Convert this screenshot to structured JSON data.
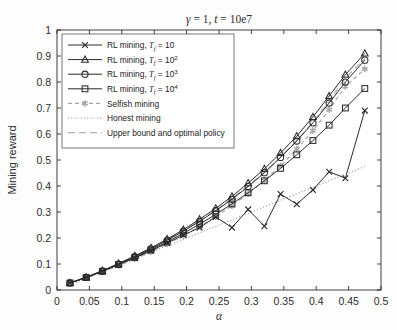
{
  "chart_data": {
    "type": "line",
    "title": "γ = 1,  t = 10e7",
    "title_parts": {
      "gamma_sym": "γ",
      "gamma_eq": " = 1,  ",
      "t_sym": "t",
      "t_eq": " = 10e7"
    },
    "xlabel": "α",
    "ylabel": "Mining reward",
    "xlim": [
      0,
      0.5
    ],
    "ylim": [
      0,
      1
    ],
    "xticks": [
      0,
      0.05,
      0.1,
      0.15,
      0.2,
      0.25,
      0.3,
      0.35,
      0.4,
      0.45,
      0.5
    ],
    "xtick_labels": [
      "0",
      "0.05",
      "0.1",
      "0.15",
      "0.2",
      "0.25",
      "0.3",
      "0.35",
      "0.4",
      "0.45",
      "0.5"
    ],
    "yticks": [
      0,
      0.1,
      0.2,
      0.3,
      0.4,
      0.5,
      0.6,
      0.7,
      0.8,
      0.9,
      1
    ],
    "ytick_labels": [
      "0",
      "0.1",
      "0.2",
      "0.3",
      "0.4",
      "0.5",
      "0.6",
      "0.7",
      "0.8",
      "0.9",
      "1"
    ],
    "grid": false,
    "legend_position": "upper left",
    "x": [
      0.02,
      0.045,
      0.07,
      0.095,
      0.12,
      0.145,
      0.17,
      0.195,
      0.22,
      0.245,
      0.27,
      0.295,
      0.32,
      0.345,
      0.37,
      0.395,
      0.42,
      0.445,
      0.475
    ],
    "series": [
      {
        "name": "RL mining, T_f = 10",
        "label_text": "RL mining, ",
        "label_sym": "T",
        "label_sub": "f",
        "label_tail": " = 10",
        "marker": "x",
        "linestyle": "solid",
        "color": "#2a2a2a",
        "values": [
          0.027,
          0.048,
          0.072,
          0.098,
          0.123,
          0.151,
          0.181,
          0.211,
          0.24,
          0.281,
          0.24,
          0.31,
          0.245,
          0.369,
          0.33,
          0.385,
          0.455,
          0.43,
          0.69
        ]
      },
      {
        "name": "RL mining, T_f = 10^2",
        "label_text": "RL mining, ",
        "label_sym": "T",
        "label_sub": "f",
        "label_tail": " = 10",
        "label_sup": "2",
        "marker": "triangle",
        "linestyle": "solid",
        "color": "#2a2a2a",
        "values": [
          0.027,
          0.049,
          0.074,
          0.102,
          0.131,
          0.162,
          0.196,
          0.232,
          0.272,
          0.314,
          0.36,
          0.411,
          0.466,
          0.527,
          0.592,
          0.666,
          0.746,
          0.828,
          0.91
        ]
      },
      {
        "name": "RL mining, T_f = 10^3",
        "label_text": "RL mining, ",
        "label_sym": "T",
        "label_sub": "f",
        "label_tail": " = 10",
        "label_sup": "3",
        "marker": "circle",
        "linestyle": "solid",
        "color": "#2a2a2a",
        "values": [
          0.027,
          0.049,
          0.073,
          0.1,
          0.128,
          0.158,
          0.191,
          0.226,
          0.264,
          0.305,
          0.349,
          0.398,
          0.451,
          0.51,
          0.573,
          0.643,
          0.719,
          0.8,
          0.884
        ]
      },
      {
        "name": "RL mining, T_f = 10^4",
        "label_text": "RL mining, ",
        "label_sym": "T",
        "label_sub": "f",
        "label_tail": " = 10",
        "label_sup": "4",
        "marker": "square",
        "linestyle": "solid",
        "color": "#2a2a2a",
        "values": [
          0.027,
          0.048,
          0.072,
          0.098,
          0.125,
          0.154,
          0.185,
          0.218,
          0.253,
          0.291,
          0.331,
          0.374,
          0.42,
          0.468,
          0.52,
          0.575,
          0.634,
          0.7,
          0.775
        ]
      },
      {
        "name": "Selfish mining",
        "label_text": "Selfish mining",
        "marker": "asterisk",
        "linestyle": "dashed",
        "color": "#a8a8a8",
        "values": [
          0.026,
          0.046,
          0.069,
          0.093,
          0.119,
          0.147,
          0.177,
          0.209,
          0.244,
          0.282,
          0.324,
          0.37,
          0.421,
          0.478,
          0.542,
          0.613,
          0.694,
          0.783,
          0.85
        ]
      },
      {
        "name": "Honest mining",
        "label_text": "Honest mining",
        "marker": "none",
        "linestyle": "dotted",
        "color": "#8f8f8f",
        "values": [
          0.02,
          0.045,
          0.07,
          0.095,
          0.12,
          0.145,
          0.17,
          0.195,
          0.22,
          0.245,
          0.27,
          0.295,
          0.32,
          0.345,
          0.37,
          0.395,
          0.42,
          0.445,
          0.475
        ]
      },
      {
        "name": "Upper bound and optimal policy",
        "label_text": "Upper bound and optimal policy",
        "marker": "none",
        "linestyle": "longdash",
        "color": "#b0b0b0",
        "values": [
          0.027,
          0.049,
          0.074,
          0.101,
          0.129,
          0.16,
          0.193,
          0.228,
          0.266,
          0.307,
          0.352,
          0.4,
          0.453,
          0.511,
          0.575,
          0.646,
          0.726,
          0.815,
          0.89
        ]
      }
    ]
  },
  "colors": {
    "axis": "#2b2b2b",
    "dark_line": "#2a2a2a",
    "light_line": "#a8a8a8",
    "background": "#fdfdfd"
  }
}
